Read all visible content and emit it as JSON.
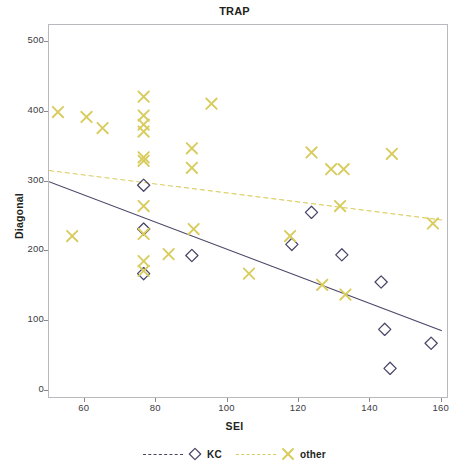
{
  "chart_data": {
    "type": "scatter",
    "title": "TRAP",
    "xlabel": "SEI",
    "ylabel": "Diagonal",
    "xlim": [
      50,
      162
    ],
    "ylim": [
      -12,
      525
    ],
    "xticks": [
      60,
      80,
      100,
      120,
      140,
      160
    ],
    "yticks": [
      0,
      100,
      200,
      300,
      400,
      500
    ],
    "grid": false,
    "legend_position": "bottom-center",
    "colors": {
      "kc": "#4a4466",
      "other": "#d9cc5e",
      "frame": "#b9b9bd",
      "text": "#231f20"
    },
    "series": [
      {
        "name": "KC",
        "marker": "diamond",
        "color": "#4a4466",
        "line_style": "dashed",
        "points": [
          {
            "x": 76.5,
            "y": 295
          },
          {
            "x": 76.5,
            "y": 232
          },
          {
            "x": 76.5,
            "y": 168
          },
          {
            "x": 90.0,
            "y": 194
          },
          {
            "x": 118.0,
            "y": 210
          },
          {
            "x": 123.5,
            "y": 256
          },
          {
            "x": 132.0,
            "y": 195
          },
          {
            "x": 143.0,
            "y": 156
          },
          {
            "x": 144.0,
            "y": 88
          },
          {
            "x": 145.5,
            "y": 32
          },
          {
            "x": 157.0,
            "y": 68
          }
        ],
        "fit_line": {
          "x0": 50,
          "y0": 300,
          "x1": 160,
          "y1": 86
        }
      },
      {
        "name": "other",
        "marker": "x",
        "color": "#d9cc5e",
        "line_style": "dashed",
        "points": [
          {
            "x": 52.5,
            "y": 400
          },
          {
            "x": 56.5,
            "y": 222
          },
          {
            "x": 60.5,
            "y": 393
          },
          {
            "x": 65.0,
            "y": 377
          },
          {
            "x": 76.5,
            "y": 422
          },
          {
            "x": 76.5,
            "y": 395
          },
          {
            "x": 76.5,
            "y": 382
          },
          {
            "x": 76.5,
            "y": 372
          },
          {
            "x": 76.5,
            "y": 335
          },
          {
            "x": 76.5,
            "y": 330
          },
          {
            "x": 76.5,
            "y": 265
          },
          {
            "x": 76.5,
            "y": 225
          },
          {
            "x": 76.5,
            "y": 186
          },
          {
            "x": 76.5,
            "y": 172
          },
          {
            "x": 83.5,
            "y": 196
          },
          {
            "x": 90.0,
            "y": 348
          },
          {
            "x": 90.0,
            "y": 320
          },
          {
            "x": 90.5,
            "y": 232
          },
          {
            "x": 95.5,
            "y": 412
          },
          {
            "x": 106.0,
            "y": 168
          },
          {
            "x": 117.5,
            "y": 222
          },
          {
            "x": 123.5,
            "y": 342
          },
          {
            "x": 126.5,
            "y": 152
          },
          {
            "x": 129.0,
            "y": 318
          },
          {
            "x": 132.5,
            "y": 318
          },
          {
            "x": 131.5,
            "y": 265
          },
          {
            "x": 133.0,
            "y": 138
          },
          {
            "x": 146.0,
            "y": 340
          },
          {
            "x": 157.5,
            "y": 240
          }
        ],
        "fit_line": {
          "x0": 50,
          "y0": 316,
          "x1": 160,
          "y1": 245
        }
      }
    ]
  },
  "legend": {
    "entries": [
      {
        "label": "KC",
        "marker": "diamond-marker",
        "color": "#4a4466"
      },
      {
        "label": "other",
        "marker": "x-marker",
        "color": "#d9cc5e"
      }
    ]
  }
}
